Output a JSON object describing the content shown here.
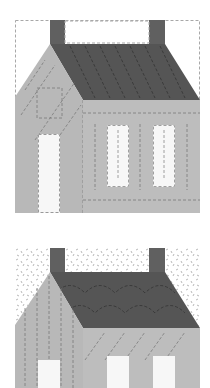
{
  "figure": {
    "colors": {
      "background": "#ffffff",
      "sky": "#ffffff",
      "roof": "#555555",
      "chimney": "#606060",
      "wall": "#bdbdbd",
      "gable": "#b8b8b8",
      "window": "#f7f7f7",
      "stitch": "#6e6e6e"
    },
    "blocks": [
      {
        "label": "house-block-straight-line-quilting",
        "sky_pattern": "plain"
      },
      {
        "label": "house-block-stipple-quilting",
        "sky_pattern": "stipple"
      }
    ]
  }
}
